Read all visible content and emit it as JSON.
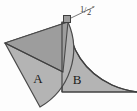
{
  "figure": {
    "background_color": "#fdfdfd",
    "outline_color": "#4a4a4a",
    "regions": [
      {
        "id": "region-a",
        "label": "A",
        "shape": "circular-sector",
        "fill": "#b4b4b4",
        "label_x": 38,
        "label_y": 83
      },
      {
        "id": "region-b",
        "label": "B",
        "shape": "concave-curved-region",
        "fill": "#b4b4b4",
        "label_x": 77,
        "label_y": 84
      },
      {
        "id": "region-triangle",
        "label": "",
        "shape": "triangle-overlay",
        "fill": "#9d9d9d",
        "label_x": 0,
        "label_y": 0
      }
    ],
    "annotations": [
      {
        "id": "right-angle-marker",
        "type": "square-marker",
        "x": 66,
        "y": 17,
        "size": 7,
        "fill": "#9d9d9d"
      },
      {
        "id": "dimension-callout",
        "type": "leader-line-label",
        "text": "1/2",
        "unit_symbol": "”",
        "numerator": "1",
        "denominator": "2",
        "label_x": 80,
        "label_y": 12,
        "leader_from_x": 71,
        "leader_from_y": 17,
        "leader_to_x": 79,
        "leader_to_y": 10
      }
    ],
    "geometry": {
      "sector_apex_x": 5,
      "sector_apex_y": 43,
      "sector_radius": 70,
      "vertex_top_x": 68,
      "vertex_top_y": 21,
      "baseline_y": 92,
      "baseline_left_x": 62,
      "baseline_right_x": 137
    }
  }
}
